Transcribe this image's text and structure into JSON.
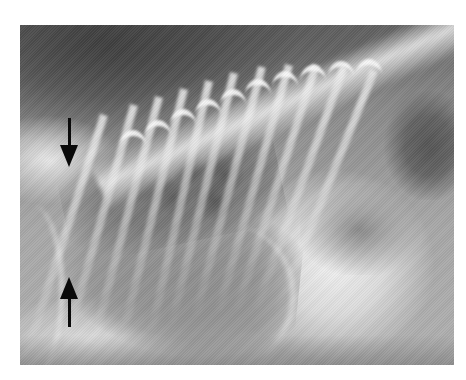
{
  "image": {
    "type": "radiograph",
    "view": "lateral thoracic",
    "colors": {
      "background": "#ffffff",
      "arrow": "#0a0a0a"
    }
  },
  "annotations": [
    {
      "id": "arrow-down",
      "direction": "down",
      "x": 69,
      "y_top": 118,
      "y_tip": 167
    },
    {
      "id": "arrow-up",
      "direction": "up",
      "x": 69,
      "y_tip": 277,
      "y_bottom": 327
    }
  ]
}
